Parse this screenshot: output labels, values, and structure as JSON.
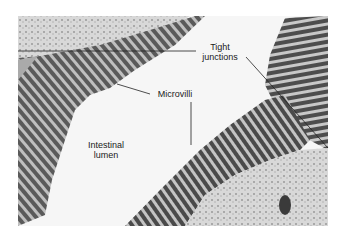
{
  "figure": {
    "labels": {
      "tight_junctions": "Tight\njunctions",
      "tight_line1": "Tight",
      "tight_line2": "junctions",
      "microvilli": "Microvilli",
      "lumen_line1": "Intestinal",
      "lumen_line2": "lumen"
    },
    "colors": {
      "background": "#ffffff",
      "cytoplasm": "#cfcfcf",
      "microvilli_dark": "#3a3a3a",
      "microvilli_light": "#bdbdbd",
      "lumen": "#f7f7f7",
      "leader_line": "#222222"
    }
  }
}
